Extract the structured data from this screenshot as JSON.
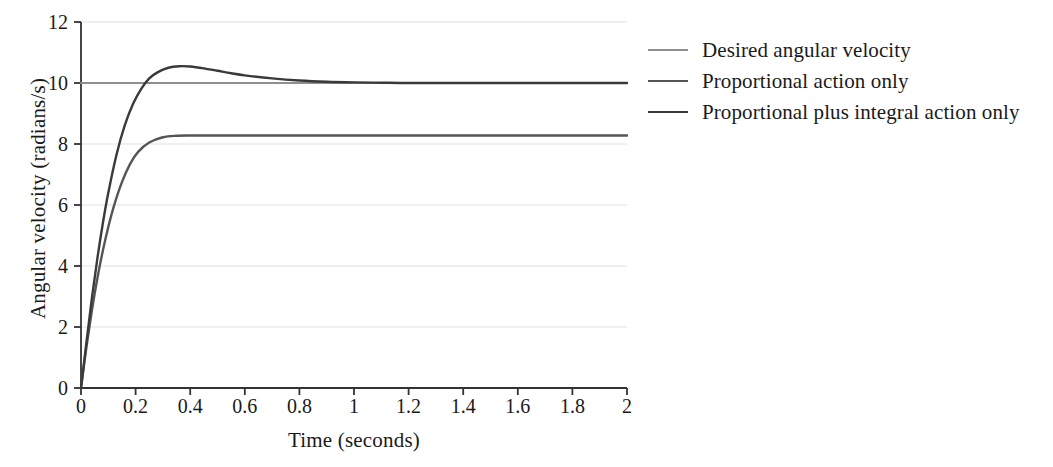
{
  "chart_data": {
    "type": "line",
    "title": "",
    "xlabel": "Time (seconds)",
    "ylabel": "Angular velocity (radians/s)",
    "xlim": [
      0,
      2
    ],
    "ylim": [
      0,
      12
    ],
    "xticks": [
      "0",
      "0.2",
      "0.4",
      "0.6",
      "0.8",
      "1",
      "1.2",
      "1.4",
      "1.6",
      "1.8",
      "2"
    ],
    "xtick_values": [
      0,
      0.2,
      0.4,
      0.6,
      0.8,
      1,
      1.2,
      1.4,
      1.6,
      1.8,
      2
    ],
    "yticks": [
      "0",
      "2",
      "4",
      "6",
      "8",
      "10",
      "12"
    ],
    "ytick_values": [
      0,
      2,
      4,
      6,
      8,
      10,
      12
    ],
    "grid": "horizontal",
    "grid_color": "#ebebeb",
    "legend_position": "right",
    "series": [
      {
        "name": "Desired angular velocity",
        "color": "#8f8f8f",
        "width": 2.2,
        "x": [
          0,
          2
        ],
        "values": [
          10,
          10
        ]
      },
      {
        "name": "Proportional action only",
        "color": "#555555",
        "width": 2.4,
        "x": [
          0,
          0.02,
          0.04,
          0.06,
          0.08,
          0.1,
          0.12,
          0.15,
          0.18,
          0.21,
          0.25,
          0.3,
          0.35,
          0.4,
          0.45,
          0.5,
          0.6,
          0.8,
          1.0,
          1.4,
          2.0
        ],
        "values": [
          0,
          1.35,
          2.55,
          3.6,
          4.5,
          5.28,
          5.95,
          6.75,
          7.35,
          7.75,
          8.05,
          8.22,
          8.27,
          8.28,
          8.28,
          8.28,
          8.28,
          8.28,
          8.28,
          8.28,
          8.28
        ]
      },
      {
        "name": "Proportional plus integral action only",
        "color": "#3a3a3a",
        "width": 2.4,
        "x": [
          0,
          0.02,
          0.04,
          0.06,
          0.08,
          0.1,
          0.13,
          0.16,
          0.19,
          0.22,
          0.25,
          0.28,
          0.32,
          0.36,
          0.4,
          0.45,
          0.5,
          0.55,
          0.6,
          0.7,
          0.8,
          0.9,
          1.0,
          1.1,
          1.2,
          1.4,
          1.6,
          2.0
        ],
        "values": [
          0,
          1.5,
          2.95,
          4.25,
          5.4,
          6.4,
          7.65,
          8.6,
          9.3,
          9.8,
          10.15,
          10.35,
          10.5,
          10.55,
          10.54,
          10.48,
          10.4,
          10.32,
          10.25,
          10.15,
          10.08,
          10.04,
          10.02,
          10.01,
          10.0,
          10.0,
          10.0,
          10.0
        ]
      }
    ]
  },
  "legend": {
    "items": [
      {
        "label": "Desired angular velocity"
      },
      {
        "label": "Proportional action only"
      },
      {
        "label": "Proportional plus integral action only"
      }
    ]
  },
  "axes": {
    "spine_color": "#333333"
  }
}
